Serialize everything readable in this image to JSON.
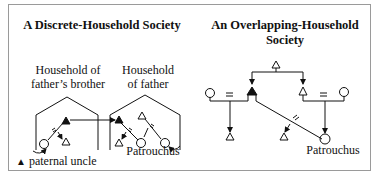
{
  "left_panel": {
    "title": "A Discrete-Household Society",
    "household_left": {
      "line1": "Household of",
      "line2": "father’s brother"
    },
    "household_right": {
      "line1": "Household",
      "line2": "of father"
    },
    "ego_label": "Patrouchus",
    "legend": {
      "symbol": "▲",
      "text": "paternal uncle"
    }
  },
  "right_panel": {
    "title_line1": "An Overlapping-Household",
    "title_line2": "Society",
    "ego_label": "Patrouchus"
  },
  "symbols": {
    "male": "triangle",
    "female": "circle",
    "marriage": "=",
    "paternal_uncle": "filled-triangle"
  },
  "colors": {
    "border": "#9a9a9a",
    "ink": "#111111",
    "background": "#ffffff"
  }
}
